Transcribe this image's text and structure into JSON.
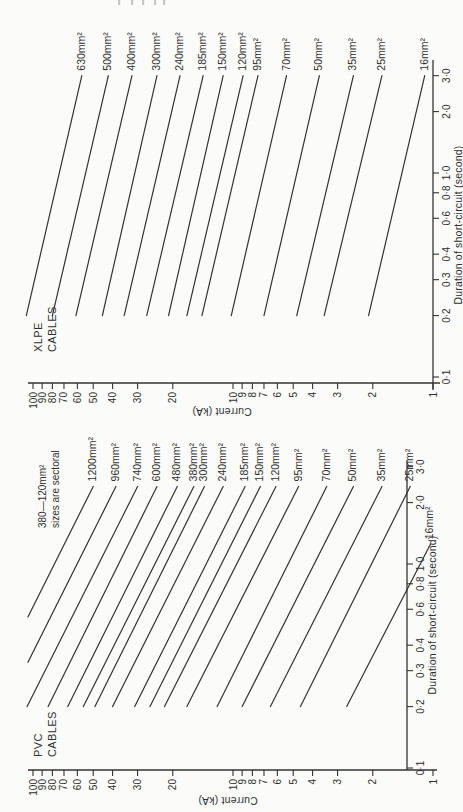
{
  "page": {
    "background": "#fbfbfa",
    "ink": "#2f2f2f",
    "line_color": "#333333",
    "artifact_color": "#9a9a9a"
  },
  "charts": [
    {
      "id": "pvc",
      "title_lines": [
        "PVC",
        "CABLES"
      ],
      "note_lines": [
        "380—120mm²",
        "sizes are sectoral"
      ],
      "x_axis": {
        "title": "Duration of short-circuit (second)",
        "ticks": [
          {
            "label": "0·1",
            "value": 0.1
          },
          {
            "label": "0·2",
            "value": 0.2
          },
          {
            "label": "0·3",
            "value": 0.3
          },
          {
            "label": "0·4",
            "value": 0.4
          },
          {
            "label": "0·6",
            "value": 0.6
          },
          {
            "label": "0·8",
            "value": 0.8
          },
          {
            "label": "1·0",
            "value": 1.0
          },
          {
            "label": "2·0",
            "value": 2.0
          },
          {
            "label": "3·0",
            "value": 3.0
          }
        ]
      },
      "y_axis": {
        "title": "Current (kA)",
        "ticks": [
          {
            "label": "1",
            "value": 1
          },
          {
            "label": "2",
            "value": 2
          },
          {
            "label": "3",
            "value": 3
          },
          {
            "label": "4",
            "value": 4
          },
          {
            "label": "5",
            "value": 5
          },
          {
            "label": "6",
            "value": 6
          },
          {
            "label": "7",
            "value": 7
          },
          {
            "label": "8",
            "value": 8
          },
          {
            "label": "9",
            "value": 9
          },
          {
            "label": "10",
            "value": 10
          },
          {
            "label": "20",
            "value": 20
          },
          {
            "label": "30",
            "value": 30
          },
          {
            "label": "40",
            "value": 40
          },
          {
            "label": "50",
            "value": 50
          },
          {
            "label": "60",
            "value": 60
          },
          {
            "label": "70",
            "value": 70
          },
          {
            "label": "80",
            "value": 80
          },
          {
            "label": "90",
            "value": 90
          },
          {
            "label": "100",
            "value": 100
          }
        ]
      }
    },
    {
      "id": "xlpe",
      "title_lines": [
        "XLPE",
        "CABLES"
      ],
      "note_lines": [],
      "x_axis": {
        "title": "Duration of short-circuit (second)",
        "ticks": [
          {
            "label": "0·1",
            "value": 0.1
          },
          {
            "label": "0·2",
            "value": 0.2
          },
          {
            "label": "0·3",
            "value": 0.3
          },
          {
            "label": "0·4",
            "value": 0.4
          },
          {
            "label": "0·6",
            "value": 0.6
          },
          {
            "label": "0·8",
            "value": 0.8
          },
          {
            "label": "1·0",
            "value": 1.0
          },
          {
            "label": "2·0",
            "value": 2.0
          },
          {
            "label": "3·0",
            "value": 3.0
          }
        ]
      },
      "y_axis": {
        "title": "Current (kA)",
        "ticks": [
          {
            "label": "1",
            "value": 1
          },
          {
            "label": "2",
            "value": 2
          },
          {
            "label": "3",
            "value": 3
          },
          {
            "label": "4",
            "value": 4
          },
          {
            "label": "5",
            "value": 5
          },
          {
            "label": "6",
            "value": 6
          },
          {
            "label": "7",
            "value": 7
          },
          {
            "label": "8",
            "value": 8
          },
          {
            "label": "9",
            "value": 9
          },
          {
            "label": "10",
            "value": 10
          },
          {
            "label": "20",
            "value": 20
          },
          {
            "label": "30",
            "value": 30
          },
          {
            "label": "40",
            "value": 40
          },
          {
            "label": "50",
            "value": 50
          },
          {
            "label": "60",
            "value": 60
          },
          {
            "label": "70",
            "value": 70
          },
          {
            "label": "80",
            "value": 80
          },
          {
            "label": "90",
            "value": 90
          },
          {
            "label": "100",
            "value": 100
          }
        ]
      }
    }
  ],
  "chart_data": [
    {
      "type": "line",
      "title": "PVC CABLES",
      "xlabel": "Duration of short-circuit (second)",
      "ylabel": "Current (kA)",
      "x_scale": "log",
      "y_scale": "log",
      "xlim": [
        0.1,
        3.5
      ],
      "ylim": [
        1,
        100
      ],
      "grid": false,
      "x_ticks": [
        0.1,
        0.2,
        0.3,
        0.4,
        0.6,
        0.8,
        1.0,
        2.0,
        3.0
      ],
      "y_ticks": [
        1,
        2,
        3,
        4,
        5,
        6,
        7,
        8,
        9,
        10,
        20,
        30,
        40,
        50,
        60,
        70,
        80,
        90,
        100
      ],
      "note": "380—120mm² sizes are sectoral",
      "series": [
        {
          "name": "1200mm²",
          "points": [
            [
              0.55,
              106
            ],
            [
              2.4,
              50
            ]
          ]
        },
        {
          "name": "960mm²",
          "points": [
            [
              0.33,
              106
            ],
            [
              2.4,
              38.5
            ]
          ]
        },
        {
          "name": "740mm²",
          "points": [
            [
              0.2,
              107
            ],
            [
              2.4,
              30
            ]
          ]
        },
        {
          "name": "600mm²",
          "points": [
            [
              0.2,
              84
            ],
            [
              2.4,
              24
            ]
          ]
        },
        {
          "name": "480mm²",
          "points": [
            [
              0.2,
              67
            ],
            [
              2.4,
              19
            ]
          ]
        },
        {
          "name": "380mm²",
          "points": [
            [
              0.2,
              56
            ],
            [
              2.4,
              15.7
            ]
          ]
        },
        {
          "name": "300mm²",
          "points": [
            [
              0.2,
              49
            ],
            [
              2.4,
              13.9
            ]
          ]
        },
        {
          "name": "240mm²",
          "points": [
            [
              0.2,
              40
            ],
            [
              2.4,
              11.2
            ]
          ]
        },
        {
          "name": "185mm²",
          "points": [
            [
              0.2,
              31
            ],
            [
              2.4,
              8.7
            ]
          ]
        },
        {
          "name": "150mm²",
          "points": [
            [
              0.2,
              26
            ],
            [
              2.4,
              7.3
            ]
          ]
        },
        {
          "name": "120mm²",
          "points": [
            [
              0.2,
              22
            ],
            [
              2.4,
              6.1
            ]
          ]
        },
        {
          "name": "95mm²",
          "points": [
            [
              0.2,
              17
            ],
            [
              2.4,
              4.7
            ]
          ]
        },
        {
          "name": "70mm²",
          "points": [
            [
              0.2,
              12
            ],
            [
              2.4,
              3.4
            ]
          ]
        },
        {
          "name": "50mm²",
          "points": [
            [
              0.2,
              9.0
            ],
            [
              2.4,
              2.5
            ]
          ]
        },
        {
          "name": "35mm²",
          "points": [
            [
              0.2,
              6.5
            ],
            [
              2.4,
              1.8
            ]
          ]
        },
        {
          "name": "25mm²",
          "points": [
            [
              0.2,
              4.6
            ],
            [
              2.4,
              1.3
            ]
          ]
        },
        {
          "name": "16mm²",
          "points": [
            [
              0.2,
              2.7
            ],
            [
              1.25,
              1.03
            ]
          ]
        }
      ]
    },
    {
      "type": "line",
      "title": "XLPE CABLES",
      "xlabel": "Duration of short-circuit (second)",
      "ylabel": "Current (kA)",
      "x_scale": "log",
      "y_scale": "log",
      "xlim": [
        0.1,
        3.5
      ],
      "ylim": [
        1,
        100
      ],
      "grid": false,
      "x_ticks": [
        0.1,
        0.2,
        0.3,
        0.4,
        0.6,
        0.8,
        1.0,
        2.0,
        3.0
      ],
      "y_ticks": [
        1,
        2,
        3,
        4,
        5,
        6,
        7,
        8,
        9,
        10,
        20,
        30,
        40,
        50,
        60,
        70,
        80,
        90,
        100
      ],
      "note": "",
      "series": [
        {
          "name": "630mm²",
          "points": [
            [
              0.2,
              108
            ],
            [
              3.0,
              57
            ]
          ]
        },
        {
          "name": "500mm²",
          "points": [
            [
              0.2,
              80
            ],
            [
              3.0,
              42
            ]
          ]
        },
        {
          "name": "400mm²",
          "points": [
            [
              0.2,
              61
            ],
            [
              3.0,
              32
            ]
          ]
        },
        {
          "name": "300mm²",
          "points": [
            [
              0.2,
              45
            ],
            [
              3.0,
              24
            ]
          ]
        },
        {
          "name": "240mm²",
          "points": [
            [
              0.2,
              35
            ],
            [
              3.0,
              18.4
            ]
          ]
        },
        {
          "name": "185mm²",
          "points": [
            [
              0.2,
              27
            ],
            [
              3.0,
              14.1
            ]
          ]
        },
        {
          "name": "150mm²",
          "points": [
            [
              0.2,
              21
            ],
            [
              3.0,
              11.2
            ]
          ]
        },
        {
          "name": "120mm²",
          "points": [
            [
              0.2,
              17
            ],
            [
              3.0,
              8.9
            ]
          ]
        },
        {
          "name": "95mm²",
          "points": [
            [
              0.2,
              14.3
            ],
            [
              3.0,
              7.5
            ]
          ]
        },
        {
          "name": "70mm²",
          "points": [
            [
              0.2,
              10.2
            ],
            [
              3.0,
              5.4
            ]
          ]
        },
        {
          "name": "50mm²",
          "points": [
            [
              0.2,
              7.0
            ],
            [
              3.0,
              3.7
            ]
          ]
        },
        {
          "name": "35mm²",
          "points": [
            [
              0.2,
              4.8
            ],
            [
              3.0,
              2.5
            ]
          ]
        },
        {
          "name": "25mm²",
          "points": [
            [
              0.2,
              3.5
            ],
            [
              3.0,
              1.8
            ]
          ]
        },
        {
          "name": "16mm²",
          "points": [
            [
              0.2,
              2.1
            ],
            [
              3.0,
              1.1
            ]
          ]
        }
      ]
    }
  ]
}
